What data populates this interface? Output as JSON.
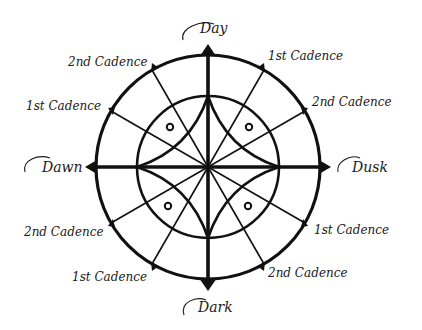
{
  "diagram": {
    "colors": {
      "ink": "#111111",
      "background": "#ffffff"
    },
    "geometry": {
      "cx": 208,
      "cy": 167,
      "outer_r": 112,
      "inner_r": 71
    },
    "cardinal_labels": {
      "top": "Day",
      "left": "Dawn",
      "right": "Dusk",
      "bottom": "Dark"
    },
    "cadence_labels": {
      "upper_left_outer": "2nd Cadence",
      "upper_left_inner": "1st Cadence",
      "upper_right_outer": "1st Cadence",
      "upper_right_inner": "2nd Cadence",
      "lower_left_inner": "2nd Cadence",
      "lower_left_outer": "1st Cadence",
      "lower_right_inner": "1st Cadence",
      "lower_right_outer": "2nd Cadence"
    },
    "small_circles": 4,
    "tick_marks": 12
  }
}
